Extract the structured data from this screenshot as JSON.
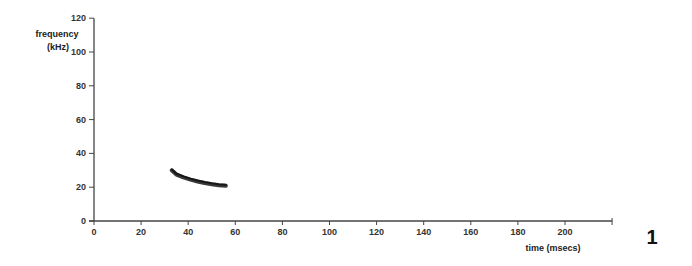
{
  "chart_data": {
    "type": "line",
    "title": "",
    "xlabel": "time (msecs)",
    "ylabel": "frequency (kHz)",
    "xlim": [
      0,
      220
    ],
    "ylim": [
      0,
      120
    ],
    "xticks": [
      0,
      20,
      40,
      60,
      80,
      100,
      120,
      140,
      160,
      180,
      200
    ],
    "yticks": [
      0,
      20,
      40,
      60,
      80,
      100,
      120
    ],
    "grid": false,
    "legend": null,
    "series": [
      {
        "name": "call",
        "x": [
          33,
          35,
          38,
          41,
          44,
          47,
          50,
          53,
          56
        ],
        "y": [
          30,
          27.5,
          25.8,
          24.5,
          23.4,
          22.5,
          21.8,
          21.2,
          20.8
        ]
      }
    ],
    "annotations": [
      {
        "text": "1",
        "role": "figure-number"
      }
    ]
  },
  "colors": {
    "axis": "#444444",
    "trace": "#222222",
    "background": "#ffffff"
  },
  "figure_number": "1"
}
